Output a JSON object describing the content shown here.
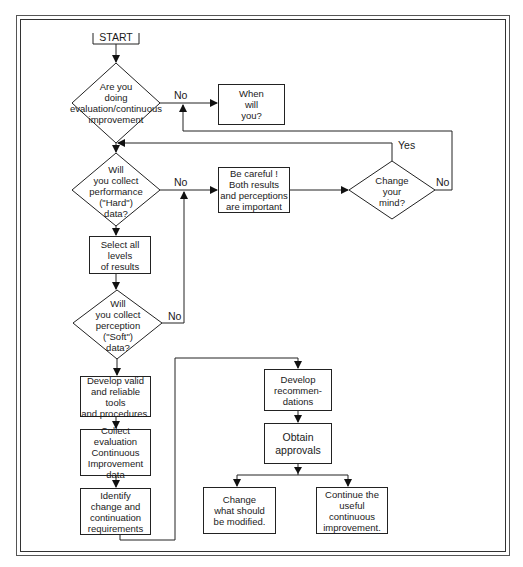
{
  "flowchart": {
    "start": "START",
    "decisions": {
      "doing_eval": "Are you\ndoing\nevaluation/continuous\nimprovement",
      "hard_data": "Will\nyou collect\nperformance\n(\"Hard\")\ndata?",
      "soft_data": "Will\nyou collect\nperception\n(\"Soft\")\ndata?",
      "change_mind": "Change\nyour\nmind?"
    },
    "processes": {
      "when_will_you": "When\nwill\nyou?",
      "be_careful": "Be careful !\nBoth results\nand perceptions\nare important",
      "select_levels": "Select all levels\nof results",
      "develop_tools": "Develop valid\nand reliable tools\nand procedures.",
      "collect_data": "Collect\nevaluation\nContinuous\nImprovement data",
      "identify_requirements": "Identify\nchange and\ncontinuation\nrequirements",
      "develop_recommendations": "Develop\nrecommen-\ndations",
      "obtain_approvals": "Obtain\napprovals",
      "change_modify": "Change\nwhat should\nbe modified.",
      "continue_improvement": "Continue the\nuseful continuous\nimprovement."
    },
    "edge_labels": {
      "doing_eval_no": "No",
      "hard_data_no": "No",
      "soft_data_no": "No",
      "change_mind_yes": "Yes",
      "change_mind_no": "No"
    }
  }
}
